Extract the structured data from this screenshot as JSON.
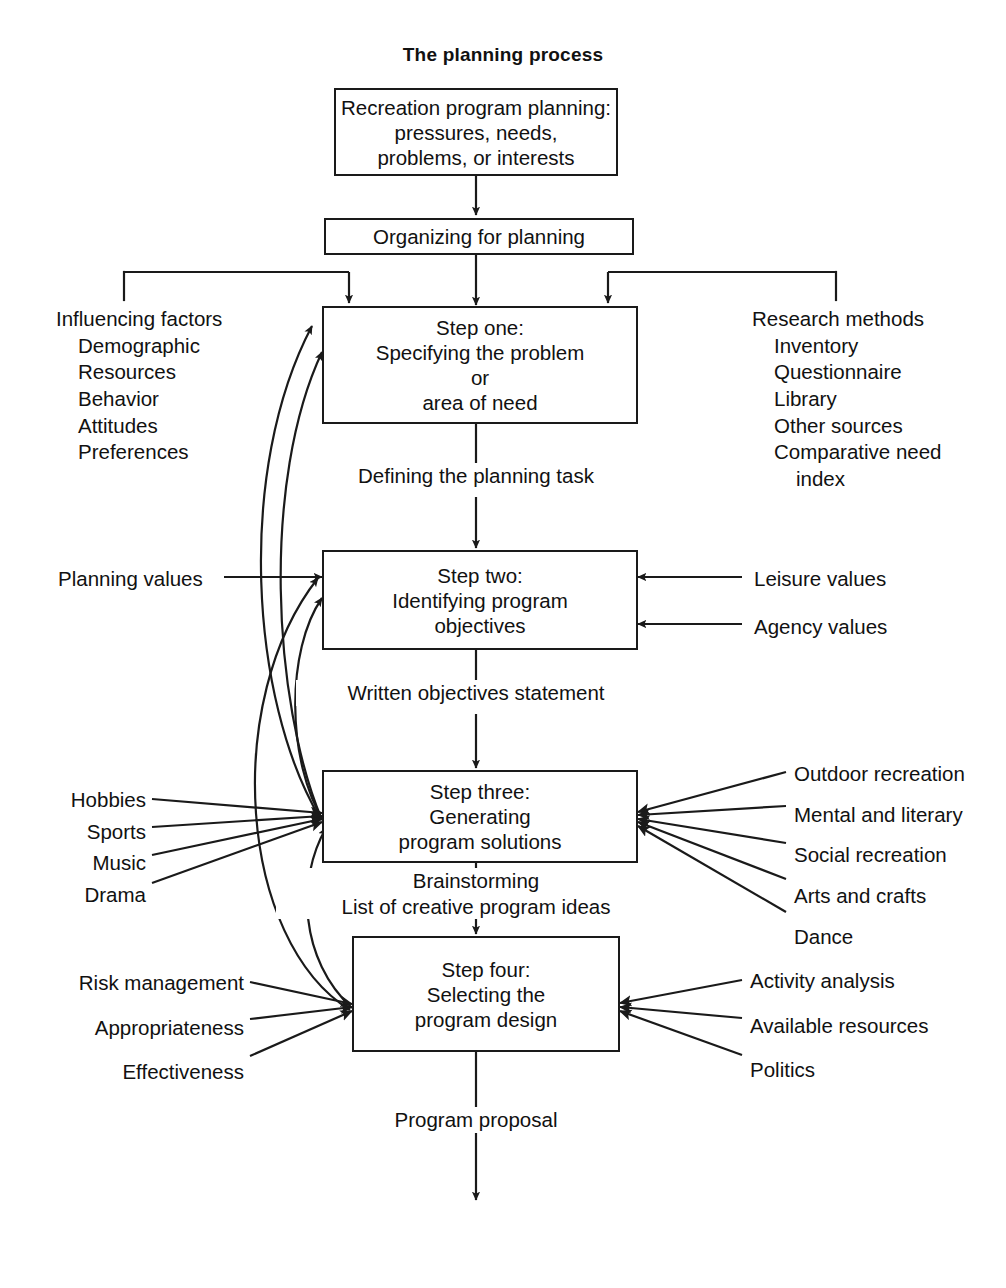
{
  "diagram": {
    "title": "The planning process",
    "nodes": {
      "start": {
        "lines": [
          "Recreation program planning:",
          "pressures, needs,",
          "problems, or interests"
        ]
      },
      "organizing": {
        "lines": [
          "Organizing for planning"
        ]
      },
      "step_one": {
        "lines": [
          "Step one:",
          "Specifying the problem",
          "or",
          "area of need"
        ]
      },
      "step_two": {
        "lines": [
          "Step two:",
          "Identifying program",
          "objectives"
        ]
      },
      "step_three": {
        "lines": [
          "Step three:",
          "Generating",
          "program solutions"
        ]
      },
      "step_four": {
        "lines": [
          "Step four:",
          "Selecting the",
          "program design"
        ]
      }
    },
    "captions": {
      "defining_task": [
        "Defining the planning task"
      ],
      "written_objectives": [
        "Written objectives statement"
      ],
      "brainstorming": [
        "Brainstorming",
        "List of creative program ideas"
      ],
      "program_proposal": [
        "Program proposal"
      ]
    },
    "side_groups": {
      "influencing_factors": {
        "heading": "Influencing factors",
        "items": [
          "Demographic",
          "Resources",
          "Behavior",
          "Attitudes",
          "Preferences"
        ]
      },
      "research_methods": {
        "heading": "Research methods",
        "items": [
          "Inventory",
          "Questionnaire",
          "Library",
          "Other sources",
          "Comparative need",
          "index"
        ]
      },
      "planning_values": {
        "items": [
          "Planning values"
        ]
      },
      "step_two_right": {
        "items": [
          "Leisure values",
          "Agency values"
        ]
      },
      "step_three_left": {
        "items": [
          "Hobbies",
          "Sports",
          "Music",
          "Drama"
        ]
      },
      "step_three_right": {
        "items": [
          "Outdoor recreation",
          "Mental and literary",
          "Social recreation",
          "Arts and crafts",
          "Dance"
        ]
      },
      "step_four_left": {
        "items": [
          "Risk management",
          "Appropriateness",
          "Effectiveness"
        ]
      },
      "step_four_right": {
        "items": [
          "Activity analysis",
          "Available resources",
          "Politics"
        ]
      }
    },
    "colors": {
      "ink": "#1a1a1a",
      "paper": "#ffffff"
    }
  }
}
